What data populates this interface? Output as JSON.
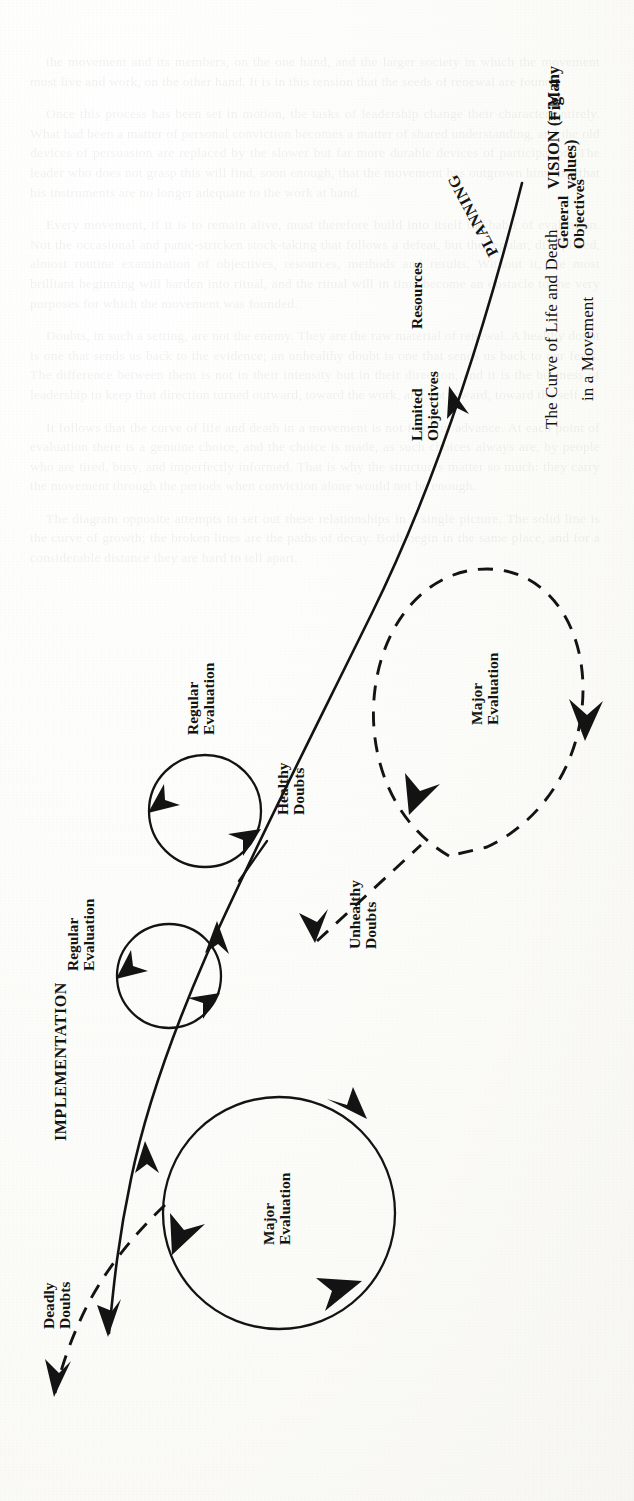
{
  "figure": {
    "number_label": "Fig. 4",
    "caption_line1": "The Curve of Life and Death",
    "caption_line2": "in a Movement",
    "origin_label": "VISION (= Many values)",
    "phases": {
      "planning": "PLANNING",
      "implementation": "IMPLEMENTATION"
    },
    "path_labels": {
      "resources": "Resources",
      "general_objectives": "General\nObjectives",
      "limited_objectives": "Limited\nObjectives"
    },
    "loops": [
      {
        "id": "regular-evaluation-lower",
        "label": "Regular\nEvaluation",
        "style": "solid"
      },
      {
        "id": "regular-evaluation-upper",
        "label": "Regular\nEvaluation",
        "style": "solid"
      },
      {
        "id": "major-evaluation-solid",
        "label": "Major\nEvaluation",
        "style": "solid"
      },
      {
        "id": "major-evaluation-dashed",
        "label": "Major\nEvaluation",
        "style": "dashed"
      }
    ],
    "doubts": [
      {
        "id": "healthy-doubts",
        "label": "Healthy\nDoubts",
        "style": "solid"
      },
      {
        "id": "unhealthy-doubts",
        "label": "Unhealthy\nDoubts",
        "style": "dashed"
      },
      {
        "id": "deadly-doubts",
        "label": "Deadly\nDoubts",
        "style": "dashed"
      }
    ],
    "colors": {
      "ink": "#141414",
      "paper": "#fdfdfb"
    }
  },
  "bleed_text": {
    "paragraphs": [
      "the movement and its members, on the one hand, and the larger society in which the movement must live and work, on the other hand. It is in this tension that the seeds of renewal are found.",
      "Once this process has been set in motion, the tasks of leadership change their character entirely. What had been a matter of personal conviction becomes a matter of shared understanding, and the old devices of persuasion are replaced by the slower but far more durable devices of participation. The leader who does not grasp this will find, soon enough, that the movement has outgrown him, and that his instruments are no longer adequate to the work at hand.",
      "Every movement, if it is to remain alive, must therefore build into itself the habit of evaluation. Not the occasional and panic-stricken stock-taking that follows a defeat, but the regular, disciplined, almost routine examination of objectives, resources, methods and results. Without it, the most brilliant beginning will harden into ritual, and the ritual will in time become an obstacle to the very purposes for which the movement was founded.",
      "Doubts, in such a setting, are not the enemy. They are the raw material of renewal. A healthy doubt is one that sends us back to the evidence; an unhealthy doubt is one that sends us back to our fears. The difference between them is not in their intensity but in their direction, and it is the business of leadership to keep that direction turned outward, toward the work, and not inward, toward the self.",
      "It follows that the curve of life and death in a movement is not fixed in advance. At each point of evaluation there is a genuine choice, and the choice is made, as such choices always are, by people who are tired, busy, and imperfectly informed. That is why the structures matter so much: they carry the movement through the periods when conviction alone would not be enough.",
      "The diagram opposite attempts to set out these relationships in a single picture. The solid line is the curve of growth; the broken lines are the paths of decay. Both begin in the same place, and for a considerable distance they are hard to tell apart."
    ]
  }
}
